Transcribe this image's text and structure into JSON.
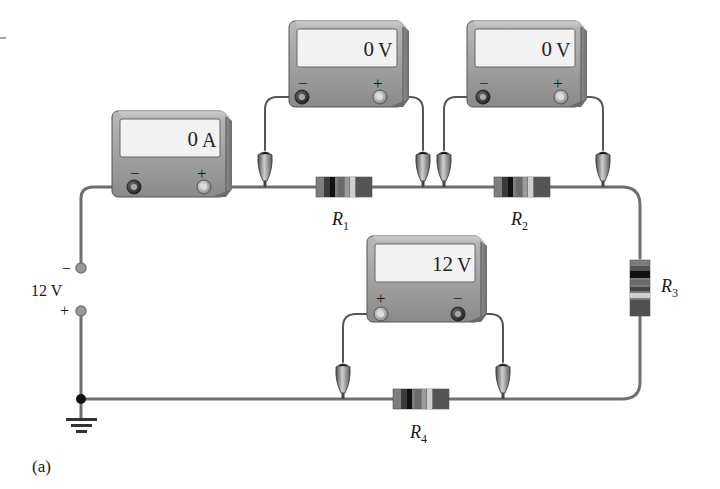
{
  "figure": {
    "caption": "(a)",
    "tick_mark": "-"
  },
  "source": {
    "voltage_label": "12 V",
    "neg_sign": "−",
    "pos_sign": "+"
  },
  "meters": [
    {
      "id": "ammeter",
      "type": "ammeter",
      "reading": "0",
      "unit": "A",
      "left_terminal": "−",
      "right_terminal": "+"
    },
    {
      "id": "voltmeter-r1",
      "type": "voltmeter",
      "reading": "0",
      "unit": "V",
      "left_terminal": "−",
      "right_terminal": "+"
    },
    {
      "id": "voltmeter-r2",
      "type": "voltmeter",
      "reading": "0",
      "unit": "V",
      "left_terminal": "−",
      "right_terminal": "+"
    },
    {
      "id": "voltmeter-r4",
      "type": "voltmeter",
      "reading": "12",
      "unit": "V",
      "left_terminal": "+",
      "right_terminal": "−"
    }
  ],
  "resistors": [
    {
      "id": "R1",
      "label": "R",
      "sub": "1"
    },
    {
      "id": "R2",
      "label": "R",
      "sub": "2"
    },
    {
      "id": "R3",
      "label": "R",
      "sub": "3"
    },
    {
      "id": "R4",
      "label": "R",
      "sub": "4"
    }
  ],
  "colors": {
    "wire": "#6e6e6e",
    "meter_body": "#8f8f8f",
    "meter_face_light": "#b4b4b4",
    "lcd": "#f2f2f2",
    "resistor_body": "#7d7d7d",
    "resistor_band_dark": "#111111",
    "resistor_band_light": "#c8c8c8"
  }
}
